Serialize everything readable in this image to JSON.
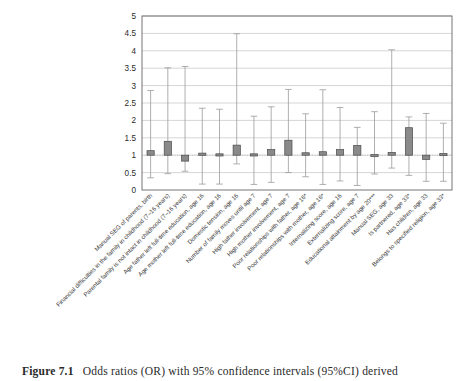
{
  "figure": {
    "caption_label": "Figure 7.1",
    "caption_body": "Odds ratios (OR) with 95% confidence intervals (95%CI) derived"
  },
  "chart_data": {
    "type": "bar",
    "title": "",
    "xlabel": "",
    "ylabel": "",
    "ylim": [
      0,
      5
    ],
    "ytick_labels": [
      "0",
      "0.5",
      "1",
      "1.5",
      "2",
      "2.5",
      "3",
      "3.5",
      "4",
      "4.5",
      "5"
    ],
    "ytick_values": [
      0,
      0.5,
      1,
      1.5,
      2,
      2.5,
      3,
      3.5,
      4,
      4.5,
      5
    ],
    "grid": true,
    "legend": "none",
    "baseline": 1,
    "categories": [
      "Manual SEG of parents, birth",
      "Financial difficulties in the family in childhood (7–16 years)",
      "Parental family is not intact in childhood (7–16 years)",
      "Age father left full-time education, age 16",
      "Age mother left full-time education, age 16",
      "Domestic tension, age 16",
      "Number of family moves until age 7",
      "High father involvement, age 7",
      "High mother involvement, age 7",
      "Poor relationships with father, age 16*",
      "Poor relationships with mother, age 16*",
      "Internalizing score, age 16",
      "Externalizing score, age 7",
      "Educational attainment by age 20***",
      "Manual SEG, age 33",
      "Is partnered, age 33*",
      "Has children, age 33",
      "Belongs to specified religion, age 33*"
    ],
    "odds_ratios": [
      1.13,
      1.4,
      0.83,
      1.06,
      1.04,
      1.29,
      1.04,
      1.16,
      1.43,
      1.07,
      1.1,
      1.16,
      1.28,
      1.02,
      1.08,
      1.79,
      0.88,
      1.05
    ],
    "ci_lower": [
      0.35,
      0.47,
      0.54,
      0.17,
      0.17,
      0.75,
      0.16,
      0.22,
      0.5,
      0.38,
      0.16,
      0.26,
      0.13,
      0.46,
      0.63,
      0.42,
      0.25,
      0.25
    ],
    "ci_upper": [
      2.86,
      3.51,
      3.55,
      2.35,
      2.32,
      4.49,
      2.12,
      2.39,
      2.89,
      2.19,
      2.88,
      2.37,
      1.8,
      2.25,
      4.03,
      2.1,
      2.2,
      1.92
    ],
    "bar_color": "#8a8a8a",
    "bar_border_color": "#4a4a4a",
    "whisker_color": "#9a9a9a",
    "grid_color": "#b9b9b9",
    "axis_color": "#666666",
    "plot_bg": "#ffffff"
  }
}
